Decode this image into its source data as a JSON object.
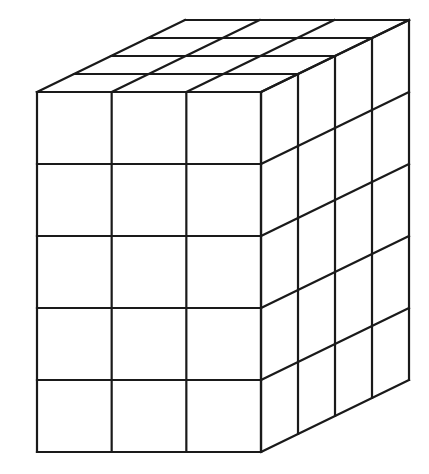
{
  "figure": {
    "dimensions": {
      "width_cubes": 3,
      "height_cubes": 5,
      "depth_cubes": 4
    },
    "total_cubes": 60,
    "geometry": {
      "front_left": 37,
      "front_top": 92,
      "cube_w": 74.67,
      "cube_h": 72,
      "depth_dx": 37,
      "depth_dy": -18
    },
    "colors": {
      "line": "#1a1a1a",
      "background": "#ffffff"
    }
  }
}
